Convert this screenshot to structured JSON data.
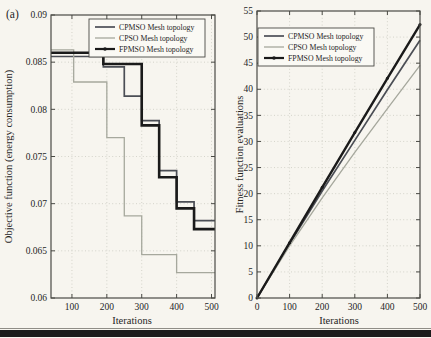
{
  "figure": {
    "panel_label": "(a)",
    "background": "#f7f5ef",
    "axis_color": "#4a4a45",
    "grid_color": "#cbcbc1",
    "text_color": "#26251f",
    "legend_fill": "#faf9f4",
    "bottom_rule_thin_color": "#8f8d86",
    "bottom_rule_thick_color": "#1c1c1c"
  },
  "legend_entries": [
    "CPMSO Mesh topology",
    "CPSO Mesh topology",
    "FPMSO Mesh topology"
  ],
  "chart_data": [
    {
      "type": "line",
      "id": "objective",
      "step": true,
      "title": "",
      "xlabel": "Iterations",
      "ylabel": "Objective function (energy consumption)",
      "xlim": [
        40,
        510
      ],
      "ylim": [
        0.06,
        0.09
      ],
      "xticks": [
        100,
        200,
        300,
        400,
        500
      ],
      "xtick_labels": [
        "100",
        "200",
        "300",
        "400",
        "500"
      ],
      "yticks": [
        0.06,
        0.065,
        0.07,
        0.075,
        0.08,
        0.085,
        0.09
      ],
      "ytick_labels": [
        "0.06",
        "0.065",
        "0.07",
        "0.075",
        "0.08",
        "0.085",
        "0.09"
      ],
      "grid": true,
      "legend_position": "top-right",
      "series": [
        {
          "name": "CPMSO Mesh topology",
          "color": "#4b4e55",
          "width": 1.7,
          "marker": false,
          "x": [
            40,
            190,
            250,
            300,
            350,
            400,
            450
          ],
          "y": [
            0.0856,
            0.0845,
            0.0814,
            0.0788,
            0.0735,
            0.0702,
            0.0682
          ]
        },
        {
          "name": "CPSO Mesh topology",
          "color": "#a6a89d",
          "width": 1.3,
          "marker": false,
          "x": [
            40,
            105,
            200,
            250,
            300,
            400
          ],
          "y": [
            0.0863,
            0.0829,
            0.077,
            0.0687,
            0.0646,
            0.0627
          ]
        },
        {
          "name": "FPMSO Mesh topology",
          "color": "#1a1a1a",
          "width": 2.6,
          "marker": true,
          "x": [
            40,
            190,
            300,
            350,
            400,
            450
          ],
          "y": [
            0.086,
            0.0848,
            0.0783,
            0.0728,
            0.0695,
            0.0673
          ]
        }
      ]
    },
    {
      "type": "line",
      "id": "evaluations",
      "step": false,
      "title": "",
      "xlabel": "Iterations",
      "ylabel": "Fitness function evaluations",
      "xlim": [
        0,
        500
      ],
      "ylim": [
        0,
        55
      ],
      "xticks": [
        0,
        100,
        200,
        300,
        400,
        500
      ],
      "xtick_labels": [
        "0",
        "100",
        "200",
        "300",
        "400",
        "500"
      ],
      "yticks": [
        0,
        5,
        10,
        15,
        20,
        25,
        30,
        35,
        40,
        45,
        50,
        55
      ],
      "ytick_labels": [
        "0",
        "5",
        "10",
        "15",
        "20",
        "25",
        "30",
        "35",
        "40",
        "45",
        "50",
        "55"
      ],
      "grid": true,
      "legend_position": "top-left",
      "series": [
        {
          "name": "CPMSO Mesh topology",
          "color": "#4b4e55",
          "width": 1.7,
          "marker": false,
          "x": [
            0,
            100,
            200,
            300,
            400,
            500
          ],
          "y": [
            0,
            10.4,
            20.5,
            30.2,
            39.9,
            49.4
          ]
        },
        {
          "name": "CPSO Mesh topology",
          "color": "#a6a89d",
          "width": 1.3,
          "marker": false,
          "x": [
            0,
            100,
            200,
            300,
            400,
            500
          ],
          "y": [
            0,
            10.0,
            19.2,
            27.9,
            36.3,
            44.6
          ]
        },
        {
          "name": "FPMSO Mesh topology",
          "color": "#1a1a1a",
          "width": 2.4,
          "marker": true,
          "x": [
            0,
            100,
            200,
            300,
            400,
            500
          ],
          "y": [
            0,
            10.6,
            21.2,
            31.7,
            42.1,
            52.4
          ]
        }
      ]
    }
  ]
}
